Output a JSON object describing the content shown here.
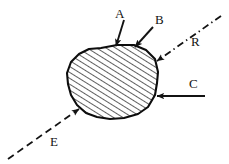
{
  "figure": {
    "kind": "hand-drawn-vector-diagram",
    "background_color": "#ffffff",
    "ink_color": "#131313",
    "body": {
      "name": "hatched-polygon",
      "fill_color": "#ffffff",
      "hatch_color": "#2a2a2a",
      "outline_color": "#0d0d0d",
      "hatch_direction": "lower-left-to-upper-right",
      "points": "101,48 117,45 134,45 146,50 155,59 158,72 157,83 155,95 148,107 138,114 124,118 110,119 97,117 86,113 77,105 71,95 68,84 67,73 71,62 79,54 89,49"
    },
    "vectors": [
      {
        "id": "A",
        "label": "A",
        "style": "solid",
        "label_x": 115,
        "label_y": 18,
        "tail_x": 124,
        "tail_y": 20,
        "head_x": 116,
        "head_y": 46,
        "description": "solid arrow pointing down into polygon top"
      },
      {
        "id": "B",
        "label": "B",
        "style": "solid",
        "label_x": 155,
        "label_y": 24,
        "tail_x": 153,
        "tail_y": 27,
        "head_x": 135,
        "head_y": 47,
        "description": "solid arrow pointing down-left into polygon top-right"
      },
      {
        "id": "R",
        "label": "R",
        "style": "dash-dot",
        "label_x": 191,
        "label_y": 46,
        "tail_x": 221,
        "tail_y": 16,
        "head_x": 157,
        "head_y": 61,
        "description": "dash-dot ray pointing down-left into polygon upper-right edge"
      },
      {
        "id": "C",
        "label": "C",
        "style": "solid",
        "label_x": 189,
        "label_y": 88,
        "tail_x": 205,
        "tail_y": 96,
        "head_x": 157,
        "head_y": 96,
        "description": "horizontal solid arrow pointing left into polygon right edge"
      },
      {
        "id": "E",
        "label": "E",
        "style": "dashed",
        "label_x": 50,
        "label_y": 146,
        "tail_x": 8,
        "tail_y": 159,
        "head_x": 79,
        "head_y": 109,
        "description": "dashed ray pointing up-right into polygon lower-left edge"
      }
    ]
  }
}
